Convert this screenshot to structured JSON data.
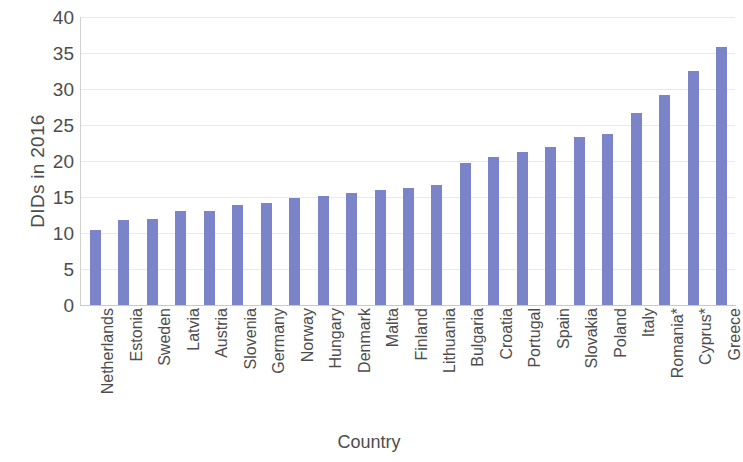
{
  "chart_data": {
    "type": "bar",
    "title": "",
    "xlabel": "Country",
    "ylabel": "DIDs in 2016",
    "ylim": [
      0,
      40
    ],
    "ytick_step": 5,
    "yticks": [
      40,
      35,
      30,
      25,
      20,
      15,
      10,
      5,
      0
    ],
    "grid": true,
    "legend": false,
    "bar_color": "#7b84c9",
    "categories": [
      "Netherlands",
      "Estonia",
      "Sweden",
      "Latvia",
      "Austria",
      "Slovenia",
      "Germany",
      "Norway",
      "Hungary",
      "Denmark",
      "Malta",
      "Finland",
      "Lithuania",
      "Bulgaria",
      "Croatia",
      "Portugal",
      "Spain",
      "Slovakia",
      "Poland",
      "Italy",
      "Romania*",
      "Cyprus*",
      "Greece"
    ],
    "values": [
      10.4,
      11.8,
      12.0,
      13.1,
      13.1,
      13.9,
      14.1,
      14.9,
      15.1,
      15.5,
      16.0,
      16.3,
      16.7,
      19.7,
      20.5,
      21.3,
      22.0,
      23.3,
      23.7,
      26.6,
      29.2,
      32.5,
      35.9
    ]
  },
  "axes": {
    "y_title": "DIDs in 2016",
    "x_title": "Country"
  }
}
